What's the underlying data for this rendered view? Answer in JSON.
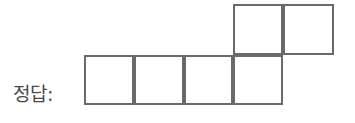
{
  "page": {
    "background_color": "#ffffff",
    "width": 355,
    "height": 123
  },
  "answer_prompt": {
    "label": "정답:",
    "color": "#4a4a4a"
  },
  "figure": {
    "name": "cube-net-hexomino",
    "stroke_color": "#6a6a6a",
    "stroke_width": 2,
    "fill_color": "transparent",
    "cell_size": 50,
    "square_count": 6,
    "rows": [
      {
        "name": "top-row",
        "y": 4,
        "cells": [
          {
            "label": "",
            "x": 233,
            "y": 4,
            "w": 50,
            "h": 51
          },
          {
            "label": "",
            "x": 283,
            "y": 4,
            "w": 51,
            "h": 51
          }
        ]
      },
      {
        "name": "bottom-row",
        "y": 55,
        "cells": [
          {
            "label": "",
            "x": 84,
            "y": 55,
            "w": 50,
            "h": 50
          },
          {
            "label": "",
            "x": 134,
            "y": 55,
            "w": 50,
            "h": 50
          },
          {
            "label": "",
            "x": 184,
            "y": 55,
            "w": 49,
            "h": 50
          },
          {
            "label": "",
            "x": 233,
            "y": 55,
            "w": 50,
            "h": 50
          }
        ]
      }
    ]
  }
}
